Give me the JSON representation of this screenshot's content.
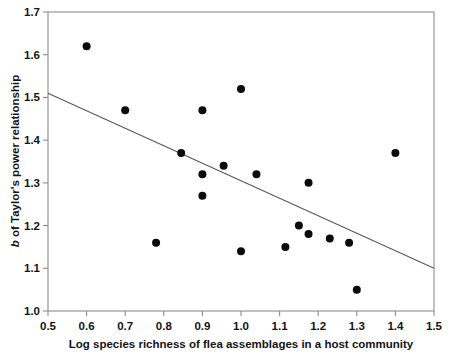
{
  "chart_data": {
    "type": "scatter",
    "title": "",
    "xlabel": "Log species richness of flea assemblages in a host community",
    "ylabel": "b of Taylor's power relationship",
    "ylabel_italic_prefix": "b",
    "ylabel_rest": " of Taylor's power relationship",
    "xlim": [
      0.5,
      1.5
    ],
    "ylim": [
      1.0,
      1.7
    ],
    "xticks": [
      0.5,
      0.6,
      0.7,
      0.8,
      0.9,
      1.0,
      1.1,
      1.2,
      1.3,
      1.4,
      1.5
    ],
    "xtick_labels": [
      "0.5",
      "0.6",
      "0.7",
      "0.8",
      "0.9",
      "1.0",
      "1.1",
      "1.2",
      "1.3",
      "1.4",
      "1.5"
    ],
    "yticks": [
      1.0,
      1.1,
      1.2,
      1.3,
      1.4,
      1.5,
      1.6,
      1.7
    ],
    "ytick_labels": [
      "1.0",
      "1.1",
      "1.2",
      "1.3",
      "1.4",
      "1.5",
      "1.6",
      "1.7"
    ],
    "grid": false,
    "legend": null,
    "marker": "filled-circle",
    "marker_color": "#0b0b0b",
    "marker_size_px": 5.2,
    "frame_color": "#8c8c8c",
    "points": [
      {
        "x": 0.6,
        "y": 1.62
      },
      {
        "x": 0.7,
        "y": 1.47
      },
      {
        "x": 0.78,
        "y": 1.16
      },
      {
        "x": 0.845,
        "y": 1.37
      },
      {
        "x": 0.9,
        "y": 1.47
      },
      {
        "x": 0.9,
        "y": 1.32
      },
      {
        "x": 0.9,
        "y": 1.27
      },
      {
        "x": 0.955,
        "y": 1.34
      },
      {
        "x": 1.0,
        "y": 1.52
      },
      {
        "x": 1.0,
        "y": 1.14
      },
      {
        "x": 1.04,
        "y": 1.32
      },
      {
        "x": 1.115,
        "y": 1.15
      },
      {
        "x": 1.15,
        "y": 1.2
      },
      {
        "x": 1.175,
        "y": 1.3
      },
      {
        "x": 1.175,
        "y": 1.18
      },
      {
        "x": 1.23,
        "y": 1.17
      },
      {
        "x": 1.28,
        "y": 1.16
      },
      {
        "x": 1.3,
        "y": 1.05
      },
      {
        "x": 1.4,
        "y": 1.37
      }
    ],
    "trendline": {
      "name": "linear-fit",
      "color": "#585858",
      "x_start": 0.5,
      "y_start": 1.51,
      "x_end": 1.5,
      "y_end": 1.1,
      "slope": -0.41,
      "intercept": 1.715
    }
  }
}
